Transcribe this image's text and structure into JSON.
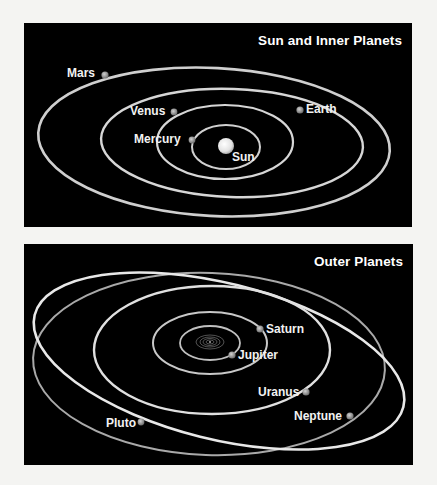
{
  "panels": {
    "inner": {
      "title": "Sun and Inner Planets",
      "sun_label": "Sun",
      "planets": [
        {
          "name": "Mercury",
          "label": "Mercury"
        },
        {
          "name": "Venus",
          "label": "Venus"
        },
        {
          "name": "Earth",
          "label": "Earth"
        },
        {
          "name": "Mars",
          "label": "Mars"
        }
      ]
    },
    "outer": {
      "title": "Outer Planets",
      "planets": [
        {
          "name": "Jupiter",
          "label": "Jupiter"
        },
        {
          "name": "Saturn",
          "label": "Saturn"
        },
        {
          "name": "Uranus",
          "label": "Uranus"
        },
        {
          "name": "Neptune",
          "label": "Neptune"
        },
        {
          "name": "Pluto",
          "label": "Pluto"
        }
      ]
    }
  },
  "colors": {
    "panel_background": "#000000",
    "page_background": "#f4f4f2",
    "orbit": "#d8d8d8",
    "sun": "#f0f0f0",
    "planet": "#9a9a9a",
    "text": "#ffffff"
  }
}
